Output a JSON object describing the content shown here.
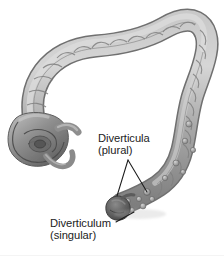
{
  "figure": {
    "kind": "anatomical-illustration",
    "style": "grayscale airbrush medical illustration",
    "background_color": "#ffffff",
    "colors": {
      "colon_light": "#d2d2d2",
      "colon_mid": "#a8a8a8",
      "colon_dark": "#7d7d7d",
      "colon_shadow": "#5f5f5f",
      "diverticulum_highlight": "#4f4f4f",
      "outline": "#6b6b6b",
      "leader_line": "#1c1c1c",
      "text": "#1c1c1c",
      "bottom_rule": "#f4f4f4"
    },
    "parts": [
      "cecum",
      "appendix",
      "ascending colon",
      "hepatic flexure",
      "transverse colon",
      "splenic flexure",
      "descending colon",
      "sigmoid colon",
      "diverticula pouches"
    ]
  },
  "labels": {
    "diverticula": {
      "line1": "Diverticula",
      "line2": "(plural)"
    },
    "diverticulum": {
      "line1": "Diverticulum",
      "line2": "(singular)"
    }
  },
  "leaders": {
    "diverticula_left": {
      "x1": 128,
      "y1": 160,
      "x2": 117,
      "y2": 196
    },
    "diverticula_right": {
      "x1": 128,
      "y1": 160,
      "x2": 147,
      "y2": 192
    },
    "diverticulum": {
      "x1": 116,
      "y1": 222,
      "x2": 134,
      "y2": 212
    }
  }
}
